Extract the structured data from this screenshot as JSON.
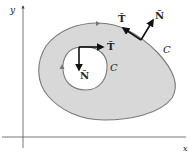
{
  "diagram": {
    "axes": {
      "x_label": "x",
      "y_label": "y"
    },
    "outer_curve": {
      "label": "C",
      "tangent_label": "T̂",
      "normal_label": "N̂"
    },
    "inner_curve": {
      "label": "C",
      "tangent_label": "T̂",
      "normal_label": "N̂"
    },
    "colors": {
      "region_fill": "#d6d6d6",
      "curve_stroke": "#7a7a7a",
      "vector": "#111111",
      "axis": "#444444"
    }
  }
}
